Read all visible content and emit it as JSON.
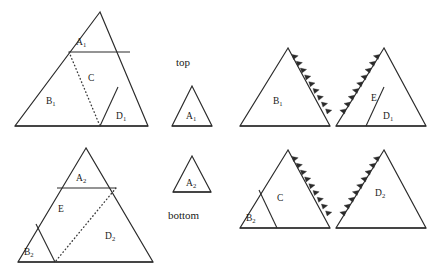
{
  "diagram": {
    "row_labels": {
      "top": "top",
      "bottom": "bottom"
    },
    "colors": {
      "stroke": "#2b2b2b",
      "dotted": "#3a3a3a",
      "background": "#ffffff",
      "text": "#1a1a1a"
    },
    "piece_labels": {
      "a1": "A",
      "a1_sub": "1",
      "a2": "A",
      "a2_sub": "2",
      "b1": "B",
      "b1_sub": "1",
      "b2": "B",
      "b2_sub": "2",
      "c": "C",
      "d1": "D",
      "d1_sub": "1",
      "d2": "D",
      "d2_sub": "2",
      "e": "E"
    },
    "figures": [
      {
        "name": "source-triangle-top",
        "row": "top",
        "column": 1,
        "pieces": [
          "A1",
          "B1",
          "C",
          "D1"
        ],
        "has_dotted_cut": true,
        "toothed_edges": []
      },
      {
        "name": "small-triangle-a1",
        "row": "top",
        "column": 2,
        "pieces": [
          "A1"
        ],
        "has_dotted_cut": false,
        "toothed_edges": []
      },
      {
        "name": "assembled-triangle-b1",
        "row": "top",
        "column": 3,
        "pieces": [
          "B1"
        ],
        "has_dotted_cut": false,
        "toothed_edges": [
          "right"
        ]
      },
      {
        "name": "assembled-triangle-e-d1",
        "row": "top",
        "column": 4,
        "pieces": [
          "E",
          "D1"
        ],
        "has_dotted_cut": false,
        "toothed_edges": [
          "left"
        ]
      },
      {
        "name": "source-triangle-bottom",
        "row": "bottom",
        "column": 1,
        "pieces": [
          "A2",
          "B2",
          "E",
          "D2"
        ],
        "has_dotted_cut": true,
        "toothed_edges": []
      },
      {
        "name": "small-triangle-a2",
        "row": "bottom",
        "column": 2,
        "pieces": [
          "A2"
        ],
        "has_dotted_cut": false,
        "toothed_edges": []
      },
      {
        "name": "assembled-triangle-b2-c",
        "row": "bottom",
        "column": 3,
        "pieces": [
          "B2",
          "C"
        ],
        "has_dotted_cut": false,
        "toothed_edges": [
          "right"
        ]
      },
      {
        "name": "assembled-triangle-d2",
        "row": "bottom",
        "column": 4,
        "pieces": [
          "D2"
        ],
        "has_dotted_cut": false,
        "toothed_edges": [
          "left"
        ]
      }
    ]
  }
}
